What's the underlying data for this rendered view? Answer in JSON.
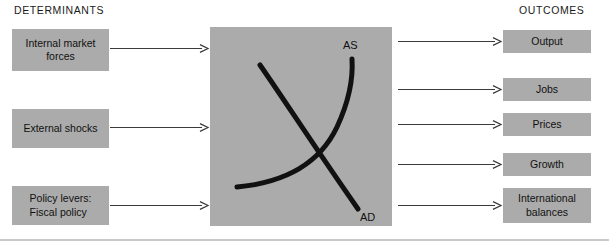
{
  "headers": {
    "determinants": "DETERMINANTS",
    "outcomes": "OUTCOMES"
  },
  "colors": {
    "box_fill": "#ababab",
    "panel_fill": "#ababab",
    "curve": "#111111",
    "arrow": "#3a3a3a",
    "rule": "#c9c9c9",
    "text": "#111111",
    "background": "#ffffff"
  },
  "determinants": [
    {
      "id": "internal-market-forces",
      "lines": [
        "Internal market",
        "forces"
      ]
    },
    {
      "id": "external-shocks",
      "lines": [
        "External shocks"
      ]
    },
    {
      "id": "policy-levers",
      "lines": [
        "Policy levers:",
        "Fiscal policy"
      ]
    }
  ],
  "outcomes": [
    {
      "id": "output",
      "lines": [
        "Output"
      ]
    },
    {
      "id": "jobs",
      "lines": [
        "Jobs"
      ]
    },
    {
      "id": "prices",
      "lines": [
        "Prices"
      ]
    },
    {
      "id": "growth",
      "lines": [
        "Growth"
      ]
    },
    {
      "id": "international-balances",
      "lines": [
        "International",
        "balances"
      ]
    }
  ],
  "asad_panel": {
    "as_label": "AS",
    "ad_label": "AD"
  }
}
